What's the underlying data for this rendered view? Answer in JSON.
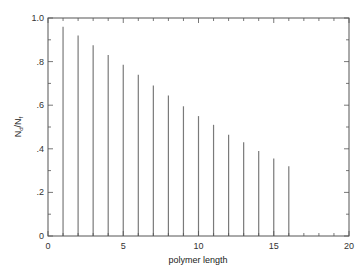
{
  "chart_data": {
    "type": "bar",
    "title": "",
    "xlabel": "polymer length",
    "ylabel": "N_d/N_f",
    "ylabel_main": "N",
    "ylabel_sub1": "d",
    "ylabel_slash": "/N",
    "ylabel_sub2": "f",
    "xlim": [
      0,
      20
    ],
    "ylim": [
      0,
      1.0
    ],
    "grid": false,
    "legend": null,
    "x_ticks": [
      0,
      5,
      10,
      15,
      20
    ],
    "x_tick_labels": [
      "0",
      "5",
      "10",
      "15",
      "20"
    ],
    "y_ticks": [
      0,
      0.2,
      0.4,
      0.6,
      0.8,
      1.0
    ],
    "y_tick_labels": [
      "0",
      ".2",
      ".4",
      ".6",
      ".8",
      "1.0"
    ],
    "x": [
      1,
      2,
      3,
      4,
      5,
      6,
      7,
      8,
      9,
      10,
      11,
      12,
      13,
      14,
      15,
      16
    ],
    "values": [
      0.96,
      0.92,
      0.875,
      0.83,
      0.785,
      0.74,
      0.69,
      0.645,
      0.595,
      0.55,
      0.51,
      0.465,
      0.43,
      0.39,
      0.355,
      0.32
    ],
    "bar_color": "#7a7a7a",
    "axis_color": "#555555"
  }
}
